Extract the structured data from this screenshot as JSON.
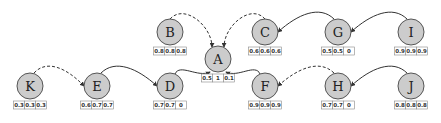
{
  "diagram": {
    "type": "directed-graph",
    "node_fill": "#cccccc",
    "node_stroke": "#555555",
    "edge_color": "#333333",
    "nodes": [
      {
        "id": "A",
        "label": "A",
        "x": 218,
        "y": 59,
        "values": [
          "0.5",
          "1",
          "0.1"
        ]
      },
      {
        "id": "B",
        "label": "B",
        "x": 170,
        "y": 32,
        "values": [
          "0.8",
          "0.8",
          "0.8"
        ]
      },
      {
        "id": "C",
        "label": "C",
        "x": 265,
        "y": 32,
        "values": [
          "0.6",
          "0.6",
          "0.6"
        ]
      },
      {
        "id": "D",
        "label": "D",
        "x": 170,
        "y": 86,
        "values": [
          "0.7",
          "0.7",
          "0"
        ]
      },
      {
        "id": "E",
        "label": "E",
        "x": 97,
        "y": 86,
        "values": [
          "0.6",
          "0.7",
          "0.7"
        ]
      },
      {
        "id": "F",
        "label": "F",
        "x": 265,
        "y": 86,
        "values": [
          "0.9",
          "0.9",
          "0.9"
        ]
      },
      {
        "id": "G",
        "label": "G",
        "x": 338,
        "y": 32,
        "values": [
          "0.5",
          "0.5",
          "0"
        ]
      },
      {
        "id": "H",
        "label": "H",
        "x": 338,
        "y": 86,
        "values": [
          "0.7",
          "0.7",
          "0"
        ]
      },
      {
        "id": "I",
        "label": "I",
        "x": 411,
        "y": 32,
        "values": [
          "0.9",
          "0.9",
          "0.9"
        ]
      },
      {
        "id": "J",
        "label": "J",
        "x": 411,
        "y": 86,
        "values": [
          "0.8",
          "0.8",
          "0.8"
        ]
      },
      {
        "id": "K",
        "label": "K",
        "x": 30,
        "y": 86,
        "values": [
          "0.3",
          "0.3",
          "0.3"
        ]
      }
    ],
    "edges": [
      {
        "from": "B",
        "to": "A",
        "style": "dashed"
      },
      {
        "from": "C",
        "to": "A",
        "style": "dashed"
      },
      {
        "from": "G",
        "to": "C",
        "style": "solid"
      },
      {
        "from": "I",
        "to": "G",
        "style": "solid"
      },
      {
        "from": "K",
        "to": "E",
        "style": "dashed"
      },
      {
        "from": "E",
        "to": "D",
        "style": "solid"
      },
      {
        "from": "D",
        "to": "A",
        "style": "solid"
      },
      {
        "from": "F",
        "to": "A",
        "style": "solid"
      },
      {
        "from": "H",
        "to": "F",
        "style": "dashed"
      },
      {
        "from": "J",
        "to": "H",
        "style": "solid"
      }
    ]
  }
}
